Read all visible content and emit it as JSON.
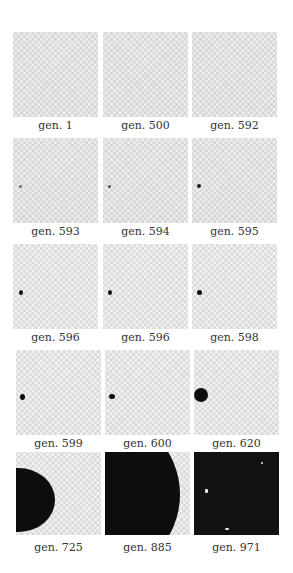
{
  "figure": {
    "panels": [
      {
        "label": "gen. 1"
      },
      {
        "label": "gen. 500"
      },
      {
        "label": "gen. 592"
      },
      {
        "label": "gen. 593"
      },
      {
        "label": "gen. 594"
      },
      {
        "label": "gen. 595"
      },
      {
        "label": "gen. 596"
      },
      {
        "label": "gen. 596"
      },
      {
        "label": "gen. 598"
      },
      {
        "label": "gen. 599"
      },
      {
        "label": "gen. 600"
      },
      {
        "label": "gen. 620"
      },
      {
        "label": "gen. 725"
      },
      {
        "label": "gen. 885"
      },
      {
        "label": "gen. 971"
      }
    ],
    "colors": {
      "background": "#ffffff",
      "noise_field": "#efefef",
      "cluster": "#0d0d0d",
      "label_text": "#333333"
    }
  }
}
